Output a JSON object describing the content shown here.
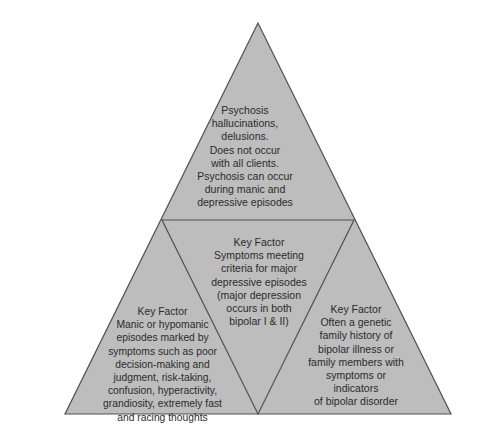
{
  "colors": {
    "fill": "#bdbdbd",
    "stroke": "#505050",
    "text": "#2b2b2b",
    "background": "#ffffff"
  },
  "diagram": {
    "type": "triangle-pyramid",
    "sections": {
      "top": {
        "text": "Psychosis\nhallucinations,\ndelusions.\nDoes not occur\nwith all clients.\nPsychosis can occur\nduring manic and\ndepressive episodes"
      },
      "center": {
        "text": "Key Factor\nSymptoms meeting\ncriteria for major\ndepressive episodes\n(major depression\noccurs in both\nbipolar I & II)"
      },
      "bottom_left": {
        "text": "Key Factor\nManic or hypomanic\nepisodes marked by\nsymptoms such as poor\ndecision-making and\njudgment, risk-taking,\nconfusion, hyperactivity,\ngrandiosity, extremely fast\nand racing thoughts"
      },
      "bottom_right": {
        "text": "Key Factor\nOften a genetic\nfamily history of\nbipolar illness or\nfamily members with\nsymptoms or\nindicators\nof bipolar disorder"
      }
    }
  }
}
